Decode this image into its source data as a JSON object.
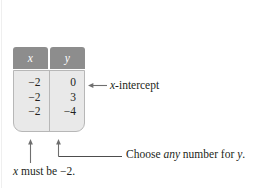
{
  "figure": {
    "kind": "math-textbook-table-figure",
    "table": {
      "headers": [
        "x",
        "y"
      ],
      "rows": [
        {
          "x": "−2",
          "y": "0"
        },
        {
          "x": "−2",
          "y": "3"
        },
        {
          "x": "−2",
          "y": "−4"
        }
      ],
      "header_bg": "#8d8d8d",
      "header_text_color": "#ffffff",
      "body_bg": "#e9e9e9",
      "border_color": "#b7b7b7"
    },
    "annotations": {
      "x_intercept": {
        "arrow": "left-arrow",
        "label_italic": "x",
        "label_rest": "-intercept",
        "full_text": "x-intercept"
      },
      "choose_any": {
        "dash": "—",
        "lead": "Choose ",
        "emphasis": "any",
        "mid": " number for ",
        "var_italic": "y",
        "tail": ".",
        "full_text": "— Choose any number for y."
      },
      "x_must_be": {
        "var_italic": "x",
        "rest": " must be −2.",
        "full_text": "x must be −2."
      }
    },
    "arrow_color": "#6f6f6f",
    "callout_line_color": "#4d4d4d"
  }
}
